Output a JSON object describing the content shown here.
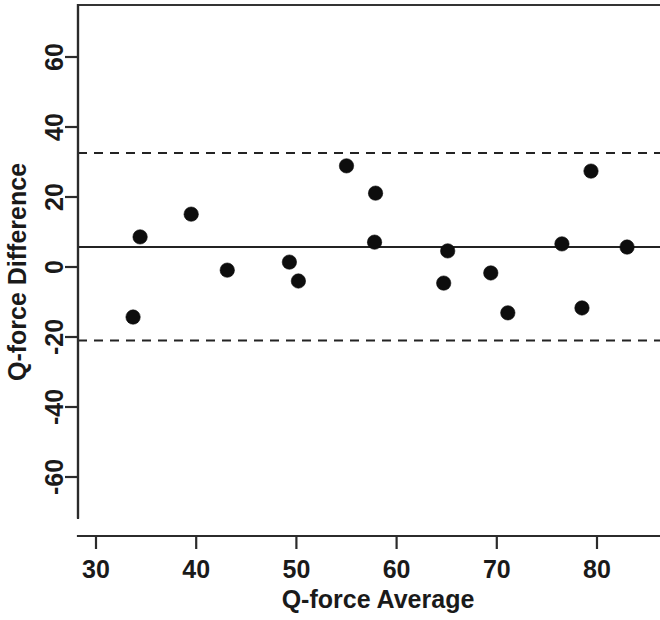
{
  "chart_data": {
    "type": "scatter",
    "title": "",
    "subtitle": "",
    "xlabel": "Q-force Average",
    "ylabel": "Q-force Difference",
    "xlim": [
      28.2,
      86.0
    ],
    "ylim": [
      -74.0,
      74.5
    ],
    "xticks": [
      30,
      40,
      50,
      60,
      70,
      80
    ],
    "xtick_labels": [
      "30",
      "40",
      "50",
      "60",
      "70",
      "80"
    ],
    "yticks": [
      60,
      40,
      20,
      0,
      -20,
      -40,
      -60
    ],
    "ytick_labels": [
      "60",
      "40",
      "20",
      "0",
      "-20",
      "-40",
      "-60"
    ],
    "grid": false,
    "legend": null,
    "point_color": "#0d0d0d",
    "line_color": "#232323",
    "frame_color": "#343434",
    "series": [
      {
        "name": "Q-force agreement",
        "marker": "filled-circle",
        "x": [
          33.7,
          34.4,
          39.5,
          43.1,
          49.3,
          50.2,
          55.0,
          57.8,
          57.9,
          64.7,
          65.1,
          69.4,
          71.1,
          76.5,
          78.5,
          79.4,
          83.0
        ],
        "y": [
          -14.3,
          8.6,
          15.1,
          -0.9,
          1.4,
          -4.0,
          28.9,
          7.1,
          21.1,
          -4.6,
          4.6,
          -1.7,
          -13.1,
          6.6,
          -11.7,
          27.4,
          5.7
        ]
      }
    ],
    "reference_lines": [
      {
        "name": "mean-difference",
        "value": 5.7,
        "style": "solid"
      },
      {
        "name": "upper-limit-of-agreement",
        "value": 32.6,
        "style": "dashed"
      },
      {
        "name": "lower-limit-of-agreement",
        "value": -21.0,
        "style": "dashed"
      }
    ]
  }
}
